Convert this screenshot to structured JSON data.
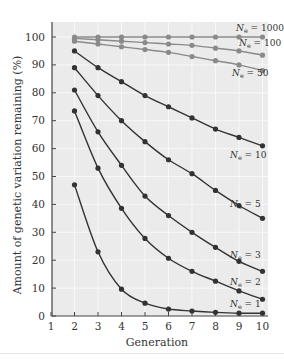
{
  "chart_data": {
    "type": "line",
    "title": "",
    "xlabel": "Generation",
    "ylabel": "Amount of genetic variation remaining (%)",
    "x": [
      2,
      3,
      4,
      5,
      6,
      7,
      8,
      9,
      10
    ],
    "xlim": [
      1,
      10
    ],
    "ylim": [
      0,
      100
    ],
    "xticks": [
      1,
      2,
      3,
      4,
      5,
      6,
      7,
      8,
      9,
      10
    ],
    "yticks": [
      0,
      10,
      20,
      30,
      40,
      50,
      60,
      70,
      80,
      90,
      100
    ],
    "grid": true,
    "legend": "inline labels at right end of each curve",
    "series": [
      {
        "name": "Ne = 1000",
        "label_main": "N",
        "label_sub": "e",
        "label_rest": " = 1000",
        "color": "#8a8a8a",
        "values": [
          100,
          100,
          100,
          100,
          100,
          100,
          100,
          100,
          100
        ]
      },
      {
        "name": "Ne = 100",
        "label_main": "N",
        "label_sub": "e",
        "label_rest": " = 100",
        "color": "#8a8a8a",
        "values": [
          99.5,
          99,
          98.5,
          98,
          97.5,
          97,
          96,
          95,
          93.5
        ]
      },
      {
        "name": "Ne = 50",
        "label_main": "N",
        "label_sub": "e",
        "label_rest": " = 50",
        "color": "#8a8a8a",
        "values": [
          98.5,
          97.5,
          96.5,
          95.5,
          94.5,
          93,
          91.5,
          90,
          88
        ]
      },
      {
        "name": "Ne = 10",
        "label_main": "N",
        "label_sub": "e",
        "label_rest": " = 10",
        "color": "#333333",
        "values": [
          95,
          89,
          84,
          79,
          75,
          71,
          67,
          64,
          61
        ]
      },
      {
        "name": "Ne = 5",
        "label_main": "N",
        "label_sub": "e",
        "label_rest": " = 5",
        "color": "#333333",
        "values": [
          89,
          79,
          70,
          62.5,
          56,
          51,
          45,
          39.6,
          35
        ]
      },
      {
        "name": "Ne = 3",
        "label_main": "N",
        "label_sub": "e",
        "label_rest": " = 3",
        "color": "#333333",
        "values": [
          81,
          66,
          54,
          43,
          36,
          30,
          24.6,
          19.6,
          16
        ]
      },
      {
        "name": "Ne = 2",
        "label_main": "N",
        "label_sub": "e",
        "label_rest": " = 2",
        "color": "#333333",
        "values": [
          73.5,
          53,
          38.6,
          27.8,
          20.7,
          16,
          12.5,
          9,
          6
        ]
      },
      {
        "name": "Ne = 1",
        "label_main": "N",
        "label_sub": "e",
        "label_rest": " = 1",
        "color": "#333333",
        "values": [
          47,
          23,
          9.6,
          4.6,
          2.5,
          1.8,
          1.3,
          1,
          1
        ]
      }
    ]
  },
  "colors": {
    "plot_background": "#ebebeb",
    "grid": "#f8f8f8",
    "axis": "#444444"
  },
  "label_positions": [
    {
      "x": 236,
      "y": 31
    },
    {
      "x": 239,
      "y": 46
    },
    {
      "x": 232,
      "y": 76
    },
    {
      "x": 230,
      "y": 158
    },
    {
      "x": 230,
      "y": 207
    },
    {
      "x": 230,
      "y": 258
    },
    {
      "x": 230,
      "y": 285
    },
    {
      "x": 230,
      "y": 307
    }
  ]
}
